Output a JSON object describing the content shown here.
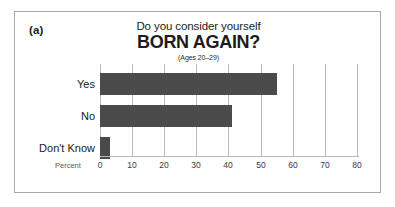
{
  "panel": {
    "label": "(a)"
  },
  "title": {
    "line1": "Do you consider yourself",
    "line2": "BORN AGAIN?",
    "subtitle": "(Ages 20–29)"
  },
  "axis": {
    "x_title": "Percent",
    "ticks": [
      "0",
      "10",
      "20",
      "30",
      "40",
      "50",
      "60",
      "70",
      "80"
    ]
  },
  "colors": {
    "bar_fill": "#4a4a4a",
    "gridline": "#b9b9b9",
    "frame": "#a8a8a8",
    "text": "#1c1c1c"
  },
  "chart_data": {
    "type": "bar",
    "orientation": "horizontal",
    "title": "Do you consider yourself BORN AGAIN?",
    "subtitle": "(Ages 20–29)",
    "categories": [
      "Yes",
      "No",
      "Don't Know"
    ],
    "values": [
      55,
      41,
      3
    ],
    "xlabel": "Percent",
    "ylabel": "",
    "xlim": [
      0,
      80
    ],
    "xticks": [
      0,
      10,
      20,
      30,
      40,
      50,
      60,
      70,
      80
    ],
    "grid": true,
    "legend": false,
    "series": [
      {
        "name": "Percent",
        "values": [
          55,
          41,
          3
        ]
      }
    ]
  }
}
